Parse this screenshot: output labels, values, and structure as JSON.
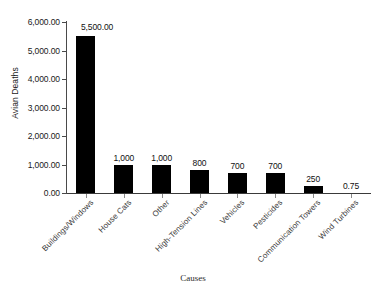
{
  "chart_data": {
    "type": "bar",
    "title": "",
    "xlabel": "Causes",
    "ylabel": "Avian Deaths",
    "categories": [
      "Buildings/Windows",
      "House Cats",
      "Other",
      "High-Tension Lines",
      "Vehicles",
      "Pesticides",
      "Communication Towers",
      "Wind Turbines"
    ],
    "values": [
      5500,
      1000,
      1000,
      800,
      700,
      700,
      250,
      0.75
    ],
    "value_labels": [
      "5,500.00",
      "1,000",
      "1,000",
      "800",
      "700",
      "700",
      "250",
      "0.75"
    ],
    "ylim": [
      0,
      6000
    ],
    "ytick_values": [
      0,
      1000,
      2000,
      3000,
      4000,
      5000,
      6000
    ],
    "ytick_labels": [
      "0.00",
      "1,000.00",
      "2,000.00",
      "3,000.00",
      "4,000.00",
      "5,000.00",
      "6,000.00"
    ],
    "grid": false,
    "legend": false,
    "bar_color": "#000000",
    "axis_color": "#3a3a3a"
  }
}
